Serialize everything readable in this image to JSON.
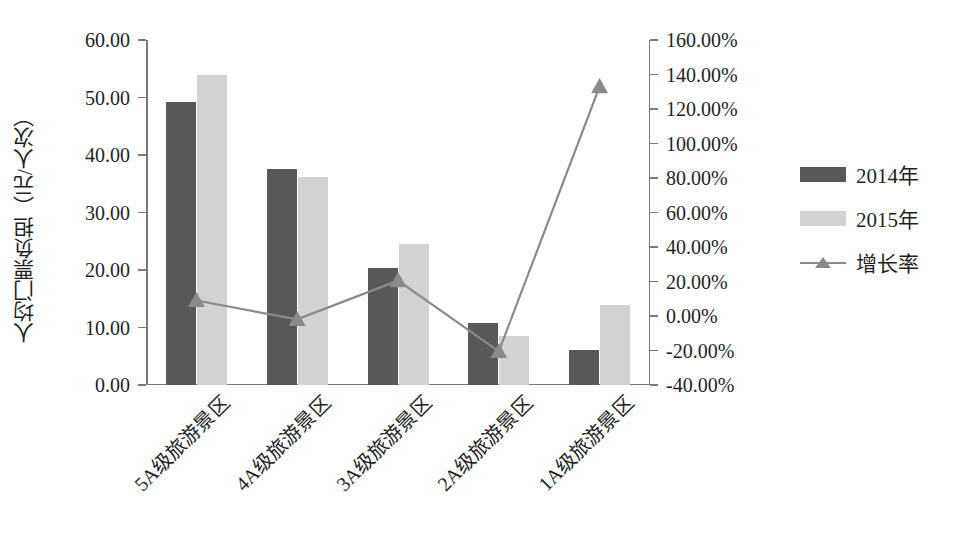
{
  "chart_data": {
    "type": "bar",
    "title": "",
    "subtitle": "",
    "categories": [
      "5A级旅游景区",
      "4A级旅游景区",
      "3A级旅游景区",
      "2A级旅游景区",
      "1A级旅游景区"
    ],
    "series": [
      {
        "name": "2014年",
        "type": "bar",
        "axis": "left",
        "color": "#585858",
        "values": [
          49.3,
          37.6,
          20.4,
          10.7,
          6.1
        ]
      },
      {
        "name": "2015年",
        "type": "bar",
        "axis": "left",
        "color": "#d2d2d2",
        "values": [
          54.0,
          36.2,
          24.6,
          8.6,
          14.0
        ]
      },
      {
        "name": "增长率",
        "type": "line",
        "axis": "right",
        "color": "#8a8a8a",
        "marker": "triangle",
        "values": [
          9.0,
          -2.0,
          20.5,
          -20.5,
          133.0
        ]
      }
    ],
    "xlabel": "",
    "ylabel": "人均门票负担（元/人次）",
    "ylim": [
      0,
      60
    ],
    "yticks": [
      0,
      10,
      20,
      30,
      40,
      50,
      60
    ],
    "ytick_labels": [
      "0.00",
      "10.00",
      "20.00",
      "30.00",
      "40.00",
      "50.00",
      "60.00"
    ],
    "y2label": "",
    "y2lim": [
      -40,
      160
    ],
    "y2ticks": [
      -40,
      -20,
      0,
      20,
      40,
      60,
      80,
      100,
      120,
      140,
      160
    ],
    "y2tick_labels": [
      "-40.00%",
      "-20.00%",
      "0.00%",
      "20.00%",
      "40.00%",
      "60.00%",
      "80.00%",
      "100.00%",
      "120.00%",
      "140.00%",
      "160.00%"
    ],
    "grid": false,
    "legend_position": "right",
    "legend_entries": [
      "2014年",
      "2015年",
      "增长率"
    ],
    "xtick_label_rotation": -45
  }
}
